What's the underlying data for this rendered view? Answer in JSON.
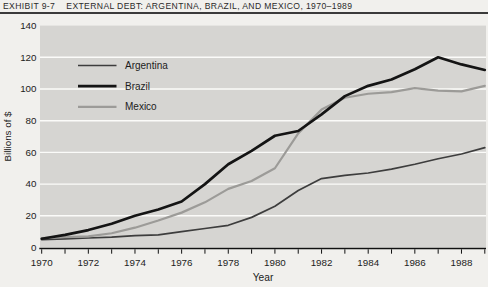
{
  "chart_data": {
    "type": "line",
    "exhibit_label": "EXHIBIT 9-7",
    "title": "EXTERNAL DEBT: ARGENTINA, BRAZIL, AND MEXICO, 1970–1989",
    "xlabel": "Year",
    "ylabel": "Billions of $",
    "ylim": [
      0,
      140
    ],
    "yticks": [
      0,
      20,
      40,
      60,
      80,
      100,
      120,
      140
    ],
    "x": [
      1970,
      1971,
      1972,
      1973,
      1974,
      1975,
      1976,
      1977,
      1978,
      1979,
      1980,
      1981,
      1982,
      1983,
      1984,
      1985,
      1986,
      1987,
      1988,
      1989
    ],
    "xticks_labeled": [
      1970,
      1972,
      1974,
      1976,
      1978,
      1980,
      1982,
      1984,
      1986,
      1988
    ],
    "grid": "horizontal-white",
    "legend_position": "upper-left",
    "colors": {
      "plot_bg": "#d6d5d2",
      "grid": "#fbfbf9",
      "axis": "#111111",
      "text": "#1c1c1c"
    },
    "series": [
      {
        "name": "Argentina",
        "color": "#3d3d3d",
        "width": 1.7,
        "values": [
          5,
          5.5,
          6,
          6.5,
          7.5,
          8,
          10,
          12,
          14,
          19,
          26,
          36,
          43.5,
          45.5,
          47,
          49.5,
          52.5,
          56,
          59,
          63
        ]
      },
      {
        "name": "Brazil",
        "color": "#141414",
        "width": 2.7,
        "values": [
          5.5,
          8,
          11,
          15,
          20,
          24,
          29,
          40,
          52.5,
          61,
          70.5,
          73.5,
          84,
          95.5,
          102,
          106,
          112.5,
          120,
          115.5,
          112
        ]
      },
      {
        "name": "Mexico",
        "color": "#9c9b98",
        "width": 2.2,
        "values": [
          6,
          6.5,
          7,
          9,
          12.5,
          17,
          22,
          28.5,
          37,
          42,
          50,
          72,
          87,
          94.5,
          97,
          98,
          100.5,
          99,
          98.5,
          102
        ]
      }
    ]
  }
}
